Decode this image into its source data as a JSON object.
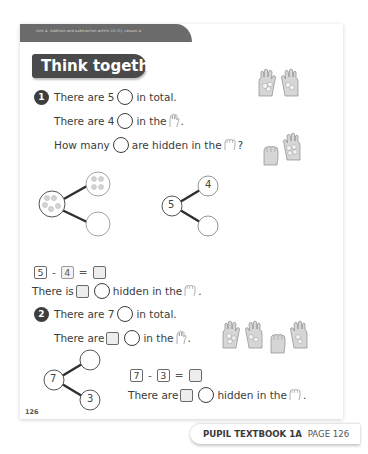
{
  "page": {
    "unit_banner": "Unit 4: Addition and subtraction within 10 (2), Lesson 4",
    "section_title": "Think together",
    "page_number": "126"
  },
  "questions": [
    {
      "number": "1",
      "lines": {
        "l1_a": "There are 5",
        "l1_b": "in total.",
        "l2_a": "There are 4",
        "l2_b": "in the",
        "l2_c": ".",
        "l3_a": "How many",
        "l3_b": "are hidden in the",
        "l3_c": "?"
      },
      "part_whole_left": {
        "whole_counters": 5,
        "part_top_counters": 4,
        "part_bottom": ""
      },
      "part_whole_right": {
        "whole": "5",
        "part_top": "4",
        "part_bottom": ""
      },
      "equation": {
        "a": "5",
        "op": "-",
        "b": "4",
        "eq": "=",
        "result": ""
      },
      "answer_line": {
        "a": "There is",
        "b": "hidden in the",
        "c": "."
      }
    },
    {
      "number": "2",
      "lines": {
        "l1_a": "There are 7",
        "l1_b": "in total.",
        "l2_a": "There are",
        "l2_b": "in the",
        "l2_c": "."
      },
      "part_whole": {
        "whole": "7",
        "part_top": "",
        "part_bottom": "3"
      },
      "equation": {
        "a": "7",
        "op": "-",
        "b": "3",
        "eq": "=",
        "result": ""
      },
      "answer_line": {
        "a": "There are",
        "b": "hidden in the",
        "c": "."
      }
    }
  ],
  "caption": {
    "book": "PUPIL TEXTBOOK 1A",
    "page": "PAGE 126"
  },
  "icons": {
    "open_hand": "open-hand-icon",
    "closed_hand": "closed-fist-icon",
    "counter": "counter-circle-icon"
  },
  "colors": {
    "banner": "#6b6b6b",
    "title_bg": "#4a4a4a",
    "text": "#3c3c3c",
    "answer_box": "#ededed"
  }
}
